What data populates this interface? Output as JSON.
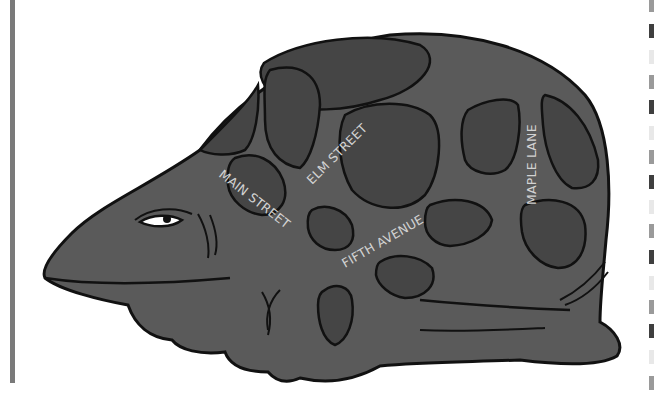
{
  "illustration": {
    "subject": "turtle-shell-street-map",
    "colors": {
      "background": "#ffffff",
      "skin": "#5a5a5a",
      "plate": "#454545",
      "outline": "#111111",
      "label": "#d2d2d2",
      "left_bar": "#7a7a7a"
    }
  },
  "streets": [
    {
      "name": "MAIN STREET"
    },
    {
      "name": "ELM STREET"
    },
    {
      "name": "FIFTH AVENUE"
    },
    {
      "name": "MAPLE LANE"
    }
  ],
  "edge_pattern": {
    "segments": [
      {
        "top": 0,
        "height": 12,
        "color": "#9a9a9a"
      },
      {
        "top": 24,
        "height": 14,
        "color": "#3f3f3f"
      },
      {
        "top": 50,
        "height": 14,
        "color": "#e8e8e8"
      },
      {
        "top": 75,
        "height": 14,
        "color": "#9a9a9a"
      },
      {
        "top": 100,
        "height": 14,
        "color": "#3f3f3f"
      },
      {
        "top": 126,
        "height": 14,
        "color": "#e8e8e8"
      },
      {
        "top": 150,
        "height": 14,
        "color": "#9a9a9a"
      },
      {
        "top": 175,
        "height": 14,
        "color": "#3f3f3f"
      },
      {
        "top": 200,
        "height": 14,
        "color": "#e8e8e8"
      },
      {
        "top": 224,
        "height": 14,
        "color": "#9a9a9a"
      },
      {
        "top": 250,
        "height": 14,
        "color": "#3f3f3f"
      },
      {
        "top": 276,
        "height": 14,
        "color": "#e8e8e8"
      },
      {
        "top": 300,
        "height": 14,
        "color": "#9a9a9a"
      },
      {
        "top": 324,
        "height": 14,
        "color": "#3f3f3f"
      },
      {
        "top": 350,
        "height": 14,
        "color": "#e8e8e8"
      },
      {
        "top": 376,
        "height": 14,
        "color": "#9a9a9a"
      }
    ]
  }
}
